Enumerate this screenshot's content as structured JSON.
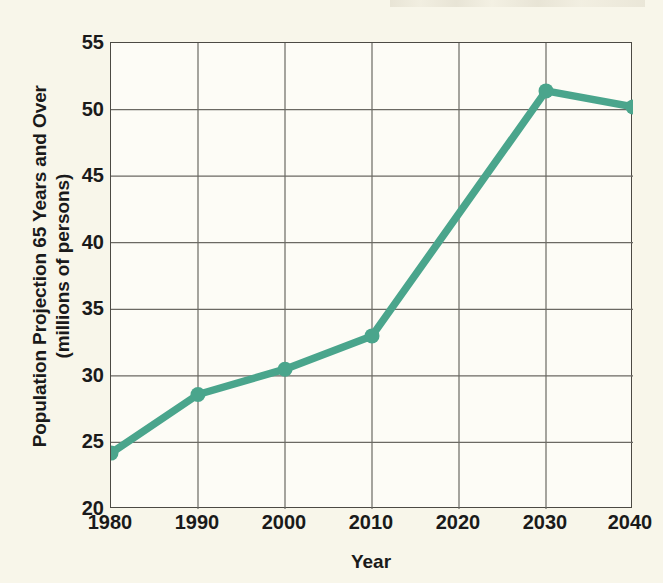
{
  "chart_data": {
    "type": "line",
    "title": "",
    "xlabel": "Year",
    "ylabel": "Population Projection 65 Years and Over (millions of persons)",
    "ylabel_line1": "Population Projection 65 Years and Over",
    "ylabel_line2": "(millions of persons)",
    "x": [
      1980,
      1990,
      2000,
      2010,
      2030,
      2040
    ],
    "values": [
      24.2,
      28.6,
      30.5,
      33.0,
      51.4,
      50.2
    ],
    "series": [
      {
        "name": "Population 65 Years and Over",
        "x": [
          1980,
          1990,
          2000,
          2010,
          2030,
          2040
        ],
        "values": [
          24.2,
          28.6,
          30.5,
          33.0,
          51.4,
          50.2
        ]
      }
    ],
    "xticks": [
      1980,
      1990,
      2000,
      2010,
      2020,
      2030,
      2040
    ],
    "xtick_labels": [
      "1980",
      "1990",
      "2000",
      "2010",
      "2020",
      "2030",
      "2040"
    ],
    "yticks": [
      20,
      25,
      30,
      35,
      40,
      45,
      50,
      55
    ],
    "ytick_labels": [
      "20",
      "25",
      "30",
      "35",
      "40",
      "45",
      "50",
      "55"
    ],
    "xlim": [
      1980,
      2040
    ],
    "ylim": [
      20,
      55
    ],
    "grid": true,
    "legend": "none",
    "line_color": "#4aa58c",
    "marker": "circle",
    "markers_at": [
      1980,
      1990,
      2000,
      2010,
      2030,
      2040
    ],
    "plot_background": "#fdfcf6",
    "page_background": "#f8f6ea",
    "axis_color": "#4c4a44",
    "grid_color": "#6b6963",
    "text_color": "#1a1a1a"
  }
}
